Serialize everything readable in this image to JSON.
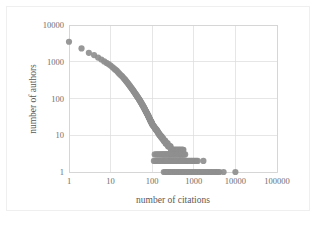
{
  "chart_data": {
    "type": "scatter",
    "title": "",
    "xlabel": "number of citations",
    "ylabel": "number of authors",
    "xscale": "log",
    "yscale": "log",
    "xlim": [
      1,
      100000
    ],
    "ylim": [
      1,
      10000
    ],
    "grid": true,
    "legend": null,
    "marker": {
      "shape": "circle",
      "color": "#8f8f8f",
      "size": 3.1
    },
    "xticks": [
      1,
      10,
      100,
      1000,
      10000,
      100000
    ],
    "xtick_labels": [
      "1",
      "10",
      "100",
      "1000",
      "10000",
      "100000"
    ],
    "yticks": [
      1,
      10,
      100,
      1000,
      10000
    ],
    "ytick_labels": [
      "1",
      "10",
      "100",
      "1000",
      "10000"
    ],
    "points": [
      [
        1,
        3500
      ],
      [
        2,
        2300
      ],
      [
        3,
        1750
      ],
      [
        4,
        1520
      ],
      [
        5,
        1300
      ],
      [
        6,
        1150
      ],
      [
        7,
        1020
      ],
      [
        8,
        930
      ],
      [
        9,
        860
      ],
      [
        10,
        790
      ],
      [
        11,
        720
      ],
      [
        12,
        660
      ],
      [
        13,
        610
      ],
      [
        14,
        570
      ],
      [
        15,
        520
      ],
      [
        16,
        480
      ],
      [
        17,
        450
      ],
      [
        18,
        420
      ],
      [
        19,
        400
      ],
      [
        20,
        370
      ],
      [
        21,
        350
      ],
      [
        22,
        330
      ],
      [
        23,
        310
      ],
      [
        24,
        290
      ],
      [
        25,
        275
      ],
      [
        26,
        260
      ],
      [
        27,
        245
      ],
      [
        28,
        232
      ],
      [
        29,
        220
      ],
      [
        30,
        208
      ],
      [
        31,
        198
      ],
      [
        32,
        188
      ],
      [
        33,
        180
      ],
      [
        34,
        172
      ],
      [
        35,
        164
      ],
      [
        36,
        156
      ],
      [
        37,
        150
      ],
      [
        38,
        143
      ],
      [
        39,
        137
      ],
      [
        40,
        131
      ],
      [
        41,
        126
      ],
      [
        42,
        121
      ],
      [
        43,
        116
      ],
      [
        44,
        112
      ],
      [
        45,
        108
      ],
      [
        46,
        104
      ],
      [
        47,
        100
      ],
      [
        48,
        96
      ],
      [
        49,
        93
      ],
      [
        50,
        90
      ],
      [
        51,
        86
      ],
      [
        52,
        83
      ],
      [
        53,
        80
      ],
      [
        54,
        77
      ],
      [
        55,
        75
      ],
      [
        56,
        72
      ],
      [
        57,
        70
      ],
      [
        58,
        67
      ],
      [
        59,
        65
      ],
      [
        60,
        63
      ],
      [
        61,
        61
      ],
      [
        62,
        59
      ],
      [
        63,
        57
      ],
      [
        64,
        55
      ],
      [
        65,
        53
      ],
      [
        66,
        52
      ],
      [
        67,
        50
      ],
      [
        68,
        48
      ],
      [
        69,
        47
      ],
      [
        70,
        45
      ],
      [
        71,
        44
      ],
      [
        72,
        43
      ],
      [
        73,
        41
      ],
      [
        74,
        40
      ],
      [
        75,
        39
      ],
      [
        76,
        38
      ],
      [
        77,
        37
      ],
      [
        78,
        36
      ],
      [
        79,
        35
      ],
      [
        80,
        34
      ],
      [
        81,
        33
      ],
      [
        82,
        32
      ],
      [
        83,
        31
      ],
      [
        84,
        30
      ],
      [
        85,
        29
      ],
      [
        86,
        29
      ],
      [
        87,
        28
      ],
      [
        88,
        27
      ],
      [
        89,
        26
      ],
      [
        90,
        26
      ],
      [
        91,
        25
      ],
      [
        92,
        24
      ],
      [
        93,
        24
      ],
      [
        94,
        23
      ],
      [
        95,
        23
      ],
      [
        96,
        22
      ],
      [
        97,
        22
      ],
      [
        98,
        21
      ],
      [
        99,
        21
      ],
      [
        100,
        20
      ],
      [
        102,
        19
      ],
      [
        104,
        19
      ],
      [
        106,
        18
      ],
      [
        108,
        18
      ],
      [
        110,
        17
      ],
      [
        112,
        17
      ],
      [
        114,
        16
      ],
      [
        116,
        16
      ],
      [
        118,
        15
      ],
      [
        120,
        15
      ],
      [
        122,
        15
      ],
      [
        124,
        14
      ],
      [
        126,
        14
      ],
      [
        128,
        14
      ],
      [
        130,
        13
      ],
      [
        132,
        13
      ],
      [
        134,
        13
      ],
      [
        136,
        12
      ],
      [
        138,
        12
      ],
      [
        140,
        12
      ],
      [
        142,
        11
      ],
      [
        144,
        11
      ],
      [
        146,
        11
      ],
      [
        148,
        11
      ],
      [
        150,
        10
      ],
      [
        153,
        10
      ],
      [
        156,
        10
      ],
      [
        159,
        10
      ],
      [
        162,
        9
      ],
      [
        165,
        9
      ],
      [
        168,
        9
      ],
      [
        171,
        9
      ],
      [
        174,
        8
      ],
      [
        177,
        8
      ],
      [
        180,
        8
      ],
      [
        183,
        8
      ],
      [
        186,
        8
      ],
      [
        190,
        7
      ],
      [
        194,
        7
      ],
      [
        198,
        7
      ],
      [
        202,
        7
      ],
      [
        206,
        7
      ],
      [
        210,
        6
      ],
      [
        215,
        6
      ],
      [
        220,
        6
      ],
      [
        225,
        6
      ],
      [
        230,
        6
      ],
      [
        235,
        6
      ],
      [
        240,
        5
      ],
      [
        246,
        5
      ],
      [
        252,
        5
      ],
      [
        258,
        5
      ],
      [
        264,
        5
      ],
      [
        270,
        5
      ],
      [
        276,
        5
      ],
      [
        283,
        4
      ],
      [
        290,
        4
      ],
      [
        297,
        4
      ],
      [
        304,
        4
      ],
      [
        312,
        4
      ],
      [
        320,
        4
      ],
      [
        328,
        4
      ],
      [
        336,
        4
      ],
      [
        345,
        4
      ],
      [
        354,
        4
      ],
      [
        363,
        4
      ],
      [
        372,
        4
      ],
      [
        382,
        4
      ],
      [
        392,
        4
      ],
      [
        402,
        4
      ],
      [
        412,
        4
      ],
      [
        423,
        4
      ],
      [
        434,
        4
      ],
      [
        445,
        4
      ],
      [
        457,
        4
      ],
      [
        469,
        4
      ],
      [
        481,
        4
      ],
      [
        494,
        4
      ],
      [
        507,
        4
      ],
      [
        520,
        4
      ],
      [
        534,
        4
      ],
      [
        548,
        4
      ],
      [
        562,
        4
      ],
      [
        115,
        3
      ],
      [
        125,
        3
      ],
      [
        135,
        3
      ],
      [
        145,
        3
      ],
      [
        155,
        3
      ],
      [
        165,
        3
      ],
      [
        175,
        3
      ],
      [
        185,
        3
      ],
      [
        195,
        3
      ],
      [
        205,
        3
      ],
      [
        216,
        3
      ],
      [
        227,
        3
      ],
      [
        239,
        3
      ],
      [
        251,
        3
      ],
      [
        264,
        3
      ],
      [
        278,
        3
      ],
      [
        292,
        3
      ],
      [
        307,
        3
      ],
      [
        323,
        3
      ],
      [
        340,
        3
      ],
      [
        357,
        3
      ],
      [
        376,
        3
      ],
      [
        395,
        3
      ],
      [
        415,
        3
      ],
      [
        437,
        3
      ],
      [
        459,
        3
      ],
      [
        483,
        3
      ],
      [
        508,
        3
      ],
      [
        534,
        3
      ],
      [
        561,
        3
      ],
      [
        590,
        3
      ],
      [
        620,
        3
      ],
      [
        110,
        2
      ],
      [
        120,
        2
      ],
      [
        130,
        2
      ],
      [
        140,
        2
      ],
      [
        150,
        2
      ],
      [
        161,
        2
      ],
      [
        172,
        2
      ],
      [
        184,
        2
      ],
      [
        197,
        2
      ],
      [
        211,
        2
      ],
      [
        226,
        2
      ],
      [
        242,
        2
      ],
      [
        259,
        2
      ],
      [
        277,
        2
      ],
      [
        297,
        2
      ],
      [
        318,
        2
      ],
      [
        340,
        2
      ],
      [
        364,
        2
      ],
      [
        390,
        2
      ],
      [
        417,
        2
      ],
      [
        447,
        2
      ],
      [
        478,
        2
      ],
      [
        512,
        2
      ],
      [
        548,
        2
      ],
      [
        587,
        2
      ],
      [
        628,
        2
      ],
      [
        672,
        2
      ],
      [
        720,
        2
      ],
      [
        770,
        2
      ],
      [
        825,
        2
      ],
      [
        883,
        2
      ],
      [
        945,
        2
      ],
      [
        1012,
        2
      ],
      [
        1083,
        2
      ],
      [
        1160,
        2
      ],
      [
        1241,
        2
      ],
      [
        1700,
        2
      ],
      [
        190,
        1
      ],
      [
        205,
        1
      ],
      [
        220,
        1
      ],
      [
        237,
        1
      ],
      [
        255,
        1
      ],
      [
        274,
        1
      ],
      [
        295,
        1
      ],
      [
        318,
        1
      ],
      [
        342,
        1
      ],
      [
        368,
        1
      ],
      [
        396,
        1
      ],
      [
        426,
        1
      ],
      [
        459,
        1
      ],
      [
        494,
        1
      ],
      [
        531,
        1
      ],
      [
        572,
        1
      ],
      [
        615,
        1
      ],
      [
        662,
        1
      ],
      [
        713,
        1
      ],
      [
        767,
        1
      ],
      [
        825,
        1
      ],
      [
        888,
        1
      ],
      [
        956,
        1
      ],
      [
        1029,
        1
      ],
      [
        1107,
        1
      ],
      [
        1191,
        1
      ],
      [
        1282,
        1
      ],
      [
        1380,
        1
      ],
      [
        1485,
        1
      ],
      [
        1598,
        1
      ],
      [
        1720,
        1
      ],
      [
        1851,
        1
      ],
      [
        1992,
        1
      ],
      [
        2144,
        1
      ],
      [
        2307,
        1
      ],
      [
        2483,
        1
      ],
      [
        2672,
        1
      ],
      [
        2875,
        1
      ],
      [
        3094,
        1
      ],
      [
        3330,
        1
      ],
      [
        3584,
        1
      ],
      [
        3857,
        1
      ],
      [
        4150,
        1
      ],
      [
        5200,
        1
      ],
      [
        10000,
        1
      ]
    ]
  }
}
